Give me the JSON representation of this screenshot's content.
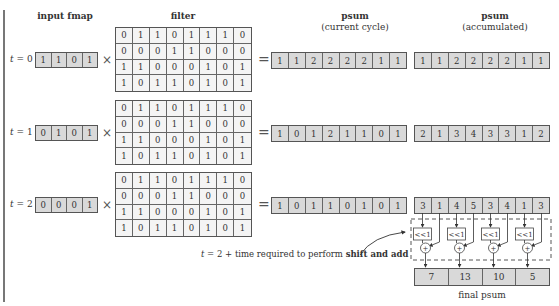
{
  "headers": {
    "input_fmap": "input fmap",
    "filter": "filter",
    "psum_current_line1": "psum",
    "psum_current_line2": "(current cycle)",
    "psum_accum_line1": "psum",
    "psum_accum_line2": "(accumulated)"
  },
  "filter": [
    [
      0,
      1,
      1,
      0,
      1,
      1,
      1,
      0
    ],
    [
      0,
      0,
      0,
      1,
      1,
      0,
      0,
      0
    ],
    [
      1,
      1,
      0,
      0,
      0,
      1,
      0,
      1
    ],
    [
      1,
      0,
      1,
      1,
      0,
      1,
      0,
      1
    ]
  ],
  "operators": {
    "times": "×",
    "equals": "="
  },
  "rows": [
    {
      "t_var": "t",
      "t_rest": " = 0",
      "input_fmap": [
        1,
        1,
        0,
        1
      ],
      "psum_current": [
        1,
        1,
        2,
        2,
        2,
        2,
        1,
        1
      ],
      "psum_accumulated": [
        1,
        1,
        2,
        2,
        2,
        2,
        1,
        1
      ]
    },
    {
      "t_var": "t",
      "t_rest": " = 1",
      "input_fmap": [
        0,
        1,
        0,
        1
      ],
      "psum_current": [
        1,
        0,
        1,
        2,
        1,
        1,
        0,
        1
      ],
      "psum_accumulated": [
        2,
        1,
        3,
        4,
        3,
        3,
        1,
        2
      ]
    },
    {
      "t_var": "t",
      "t_rest": " = 2",
      "input_fmap": [
        0,
        0,
        0,
        1
      ],
      "psum_current": [
        1,
        0,
        1,
        1,
        0,
        1,
        0,
        1
      ],
      "psum_accumulated": [
        3,
        1,
        4,
        5,
        3,
        4,
        1,
        3
      ]
    }
  ],
  "shift_add": {
    "shift_label": "<<1",
    "adder_label": "+",
    "count": 4
  },
  "annotation": {
    "t_var": "t",
    "prefix": " = 2 + time required to perform ",
    "bold": "shift and add"
  },
  "final_psum": {
    "values": [
      7,
      13,
      10,
      5
    ],
    "label": "final psum"
  }
}
